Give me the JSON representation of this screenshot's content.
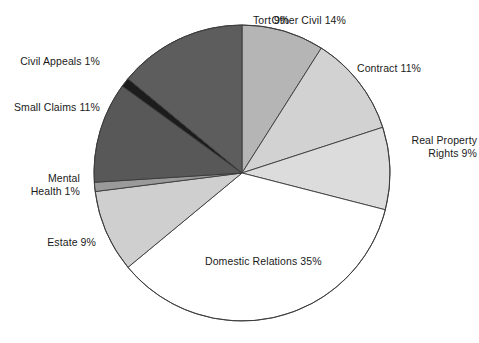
{
  "chart_data": {
    "type": "pie",
    "title": "",
    "subtitle": "",
    "xlabel": "",
    "ylabel": "",
    "legend_position": "none",
    "grid": false,
    "units": "percent",
    "total": 100,
    "start_angle_deg": 0,
    "direction": "clockwise",
    "categories": [
      "Tort",
      "Contract",
      "Real Property Rights",
      "Domestic Relations",
      "Estate",
      "Mental Health",
      "Small Claims",
      "Civil Appeals",
      "Other Civil"
    ],
    "values": [
      9,
      11,
      9,
      35,
      9,
      1,
      11,
      1,
      14
    ],
    "slice_colors": [
      "#b5b5b5",
      "#d2d2d2",
      "#dcdcdc",
      "#ffffff",
      "#cfcfcf",
      "#9a9a9a",
      "#585858",
      "#1c1c1c",
      "#5d5d5d"
    ],
    "slices": [
      {
        "label": "Tort",
        "value": 9,
        "color": "#b5b5b5"
      },
      {
        "label": "Contract",
        "value": 11,
        "color": "#d2d2d2"
      },
      {
        "label": "Real Property Rights",
        "value": 9,
        "color": "#dcdcdc"
      },
      {
        "label": "Domestic Relations",
        "value": 35,
        "color": "#ffffff"
      },
      {
        "label": "Estate",
        "value": 9,
        "color": "#cfcfcf"
      },
      {
        "label": "Mental Health",
        "value": 1,
        "color": "#9a9a9a"
      },
      {
        "label": "Small Claims",
        "value": 11,
        "color": "#585858"
      },
      {
        "label": "Civil Appeals",
        "value": 1,
        "color": "#1c1c1c"
      },
      {
        "label": "Other Civil",
        "value": 14,
        "color": "#5d5d5d"
      }
    ],
    "annotations": [
      {
        "text": "Tort 9%"
      },
      {
        "text": "Contract 11%"
      },
      {
        "text": "Real Property\nRights 9%"
      },
      {
        "text": "Domestic Relations 35%"
      },
      {
        "text": "Estate 9%"
      },
      {
        "text": "Mental\nHealth 1%"
      },
      {
        "text": "Small Claims 11%"
      },
      {
        "text": "Civil Appeals 1%"
      },
      {
        "text": "Other Civil 14%"
      }
    ]
  },
  "labels": {
    "tort": "Tort 9%",
    "contract": "Contract 11%",
    "real_property": "Real Property\nRights 9%",
    "domestic_relations": "Domestic Relations 35%",
    "estate": "Estate 9%",
    "mental_health": "Mental\nHealth 1%",
    "small_claims": "Small Claims 11%",
    "civil_appeals": "Civil Appeals 1%",
    "other_civil": "Other Civil 14%"
  },
  "style": {
    "stroke": "#3a3a3a",
    "background": "#ffffff",
    "text_color": "#1a1a1a"
  }
}
